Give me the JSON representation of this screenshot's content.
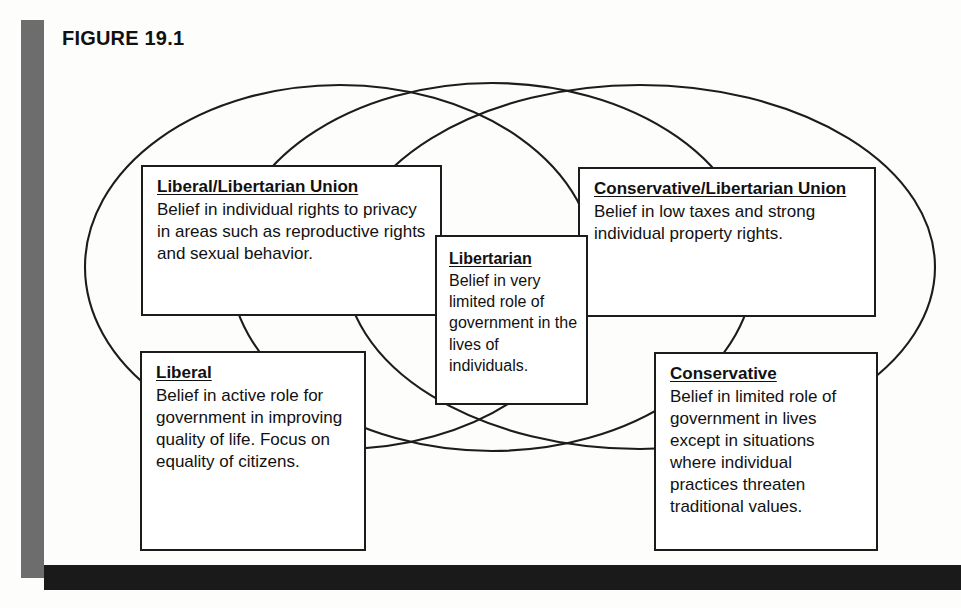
{
  "figure": {
    "label": "FIGURE 19.1"
  },
  "diagram_data": {
    "type": "venn-diagram",
    "ellipse_count": 3,
    "ellipses": [
      {
        "name": "liberal-ellipse",
        "cx": 340,
        "cy": 267,
        "rx": 255,
        "ry": 183
      },
      {
        "name": "libertarian-ellipse",
        "cx": 490,
        "cy": 267,
        "rx": 255,
        "ry": 183
      },
      {
        "name": "conservative-ellipse",
        "cx": 640,
        "cy": 267,
        "rx": 295,
        "ry": 183
      }
    ],
    "boxes": [
      "liberal-libertarian-union",
      "conservative-libertarian-union",
      "libertarian",
      "liberal",
      "conservative"
    ]
  },
  "boxes": {
    "liberal_libertarian_union": {
      "title": "Liberal/Libertarian Union",
      "body": "Belief in individual rights to privacy in areas such as reproductive rights and sexual behavior."
    },
    "conservative_libertarian_union": {
      "title": "Conservative/Libertarian Union",
      "body": "Belief in low taxes and strong individual property rights."
    },
    "libertarian": {
      "title": "Libertarian",
      "body": "Belief in very limited role of government in the lives of individuals."
    },
    "liberal": {
      "title": "Liberal",
      "body": "Belief in active role for government in improving quality of life. Focus on equality of citizens."
    },
    "conservative": {
      "title": "Conservative",
      "body": "Belief in limited role of government in lives except in situations where individual practices threaten traditional values."
    }
  },
  "colors": {
    "rail_gray": "#6d6d6d",
    "rule_black": "#1a1a1a",
    "stroke": "#1c1c1c",
    "text": "#111111",
    "page_background": "#fdfdfc"
  }
}
